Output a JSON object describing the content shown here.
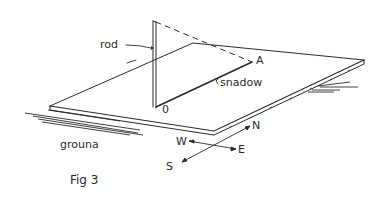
{
  "figure": {
    "caption": "Fig 3",
    "labels": {
      "rod": "rod",
      "shadow": "snadow",
      "point_a": "A",
      "point_o": "0",
      "ground": "grouna",
      "north": "N",
      "south": "S",
      "east": "E",
      "west": "W"
    },
    "colors": {
      "ink": "#2a2a2a",
      "background": "#ffffff"
    }
  }
}
